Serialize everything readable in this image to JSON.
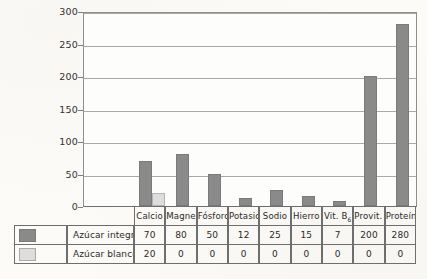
{
  "chart_data": {
    "type": "bar",
    "title": "",
    "xlabel": "",
    "ylabel": "",
    "ylim": [
      0,
      300
    ],
    "yticks": [
      0,
      50,
      100,
      150,
      200,
      250,
      300
    ],
    "grid": true,
    "legend_position": "table-left",
    "categories": [
      "Calcio",
      "Magnesio",
      "Fósforo",
      "Potasio",
      "Sodio",
      "Hierro",
      "Vit. B",
      "Provit. A",
      "Proteínas"
    ],
    "category_subscripts": [
      "",
      "",
      "",
      "",
      "",
      "",
      "6",
      "",
      ""
    ],
    "series": [
      {
        "name": "Azúcar integral",
        "color": "#8a8a8a",
        "values": [
          70,
          80,
          50,
          12,
          25,
          15,
          7,
          200,
          280
        ]
      },
      {
        "name": "Azúcar blanco",
        "color": "#dddddd",
        "values": [
          20,
          0,
          0,
          0,
          0,
          0,
          0,
          0,
          0
        ]
      }
    ]
  },
  "axis": {
    "y_tick_labels": [
      "300",
      "250",
      "200",
      "150",
      "100",
      "50",
      "0"
    ]
  },
  "table": {
    "header_row": [
      "Calcio",
      "Magnesio",
      "Fósforo",
      "Potasio",
      "Sodio",
      "Hierro",
      "Vit. B",
      "Provit. A",
      "Proteínas"
    ],
    "header_subscripts": [
      "",
      "",
      "",
      "",
      "",
      "",
      "6",
      "",
      ""
    ],
    "rows": [
      {
        "label": "Azúcar integral",
        "swatch": "dark-swatch",
        "values": [
          "70",
          "80",
          "50",
          "12",
          "25",
          "15",
          "7",
          "200",
          "280"
        ]
      },
      {
        "label": "Azúcar blanco",
        "swatch": "light-swatch",
        "values": [
          "20",
          "0",
          "0",
          "0",
          "0",
          "0",
          "0",
          "0",
          "0"
        ]
      }
    ]
  },
  "colors": {
    "series_dark": "#8a8a8a",
    "series_light": "#dddddd",
    "grid": "#a9a9a9",
    "frame": "#8e8e8e",
    "table_border": "#6e6e6e",
    "background": "#fcfbf8"
  }
}
